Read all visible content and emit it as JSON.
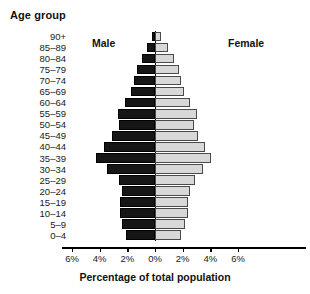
{
  "chart": {
    "type_label": "population-pyramid",
    "age_group_heading": "Age group",
    "male_label": "Male",
    "female_label": "Female",
    "xaxis_title": "Percentage of total population",
    "male_color": "#161616",
    "female_color": "#d8d8d8"
  },
  "chart_data": {
    "type": "bar",
    "title": "",
    "subtitle": "",
    "xlabel": "Percentage of total population",
    "ylabel": "Age group",
    "orientation": "horizontal",
    "layout": "population-pyramid",
    "grid": false,
    "legend_position": "inside-top",
    "xlim": [
      -6,
      6
    ],
    "xticks": [
      -6,
      -4,
      -2,
      0,
      2,
      4,
      6
    ],
    "xticklabels": [
      "6%",
      "4%",
      "2%",
      "0%",
      "2%",
      "4%",
      "6%"
    ],
    "categories": [
      "90+",
      "85–89",
      "80–84",
      "75–79",
      "70–74",
      "65–69",
      "60–64",
      "55–59",
      "50–54",
      "45–49",
      "40–44",
      "35–39",
      "30–34",
      "25–29",
      "20–24",
      "15–19",
      "10–14",
      "5–9",
      "0–4"
    ],
    "series": [
      {
        "name": "Male",
        "color": "#161616",
        "side": "left",
        "values": [
          0.25,
          0.6,
          0.95,
          1.3,
          1.5,
          1.75,
          2.2,
          2.7,
          2.6,
          3.1,
          3.7,
          4.3,
          3.5,
          2.6,
          2.4,
          2.5,
          2.5,
          2.4,
          2.1
        ]
      },
      {
        "name": "Female",
        "color": "#d8d8d8",
        "side": "right",
        "values": [
          0.45,
          0.95,
          1.4,
          1.75,
          1.9,
          2.1,
          2.5,
          3.0,
          2.8,
          3.1,
          3.6,
          4.05,
          3.5,
          2.9,
          2.5,
          2.4,
          2.35,
          2.2,
          1.9
        ]
      }
    ]
  }
}
